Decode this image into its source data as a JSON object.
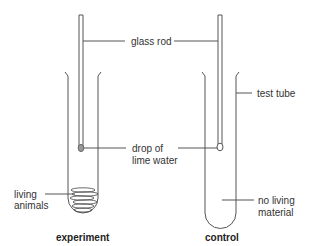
{
  "diagram": {
    "labels": {
      "glass_rod": "glass rod",
      "test_tube": "test tube",
      "drop_line1": "drop of",
      "drop_line2": "lime water",
      "living_line1": "living",
      "living_line2": "animals",
      "no_living_line1": "no living",
      "no_living_line2": "material"
    },
    "captions": {
      "left": "experiment",
      "right": "control"
    },
    "colors": {
      "line": "#555555",
      "drop": "#999999",
      "text": "#333333"
    }
  }
}
